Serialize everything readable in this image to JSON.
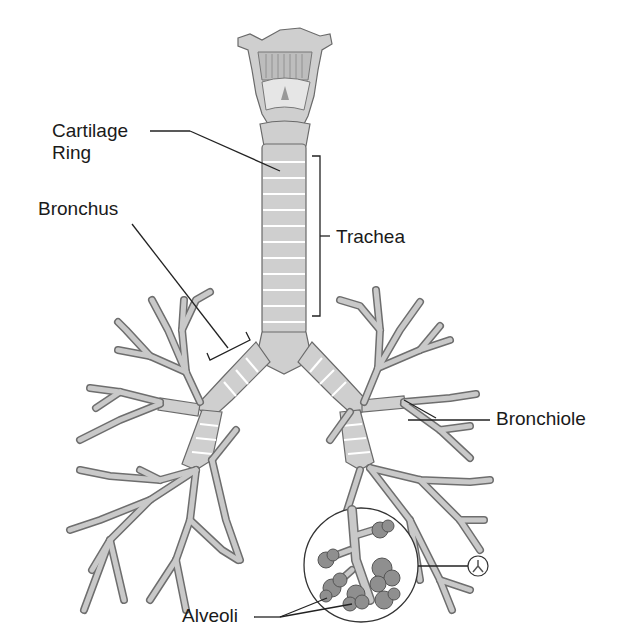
{
  "diagram": {
    "type": "anatomical-illustration",
    "labels": {
      "cartilage_ring_line1": "Cartilage",
      "cartilage_ring_line2": "Ring",
      "bronchus": "Bronchus",
      "trachea": "Trachea",
      "bronchiole": "Bronchiole",
      "alveoli": "Alveoli"
    },
    "colors": {
      "tissue_fill": "#cfcfcf",
      "tissue_outline": "#6a6a6a",
      "alveoli_fill": "#8f8f8f",
      "text": "#1a1a1a",
      "background": "#ffffff"
    }
  }
}
